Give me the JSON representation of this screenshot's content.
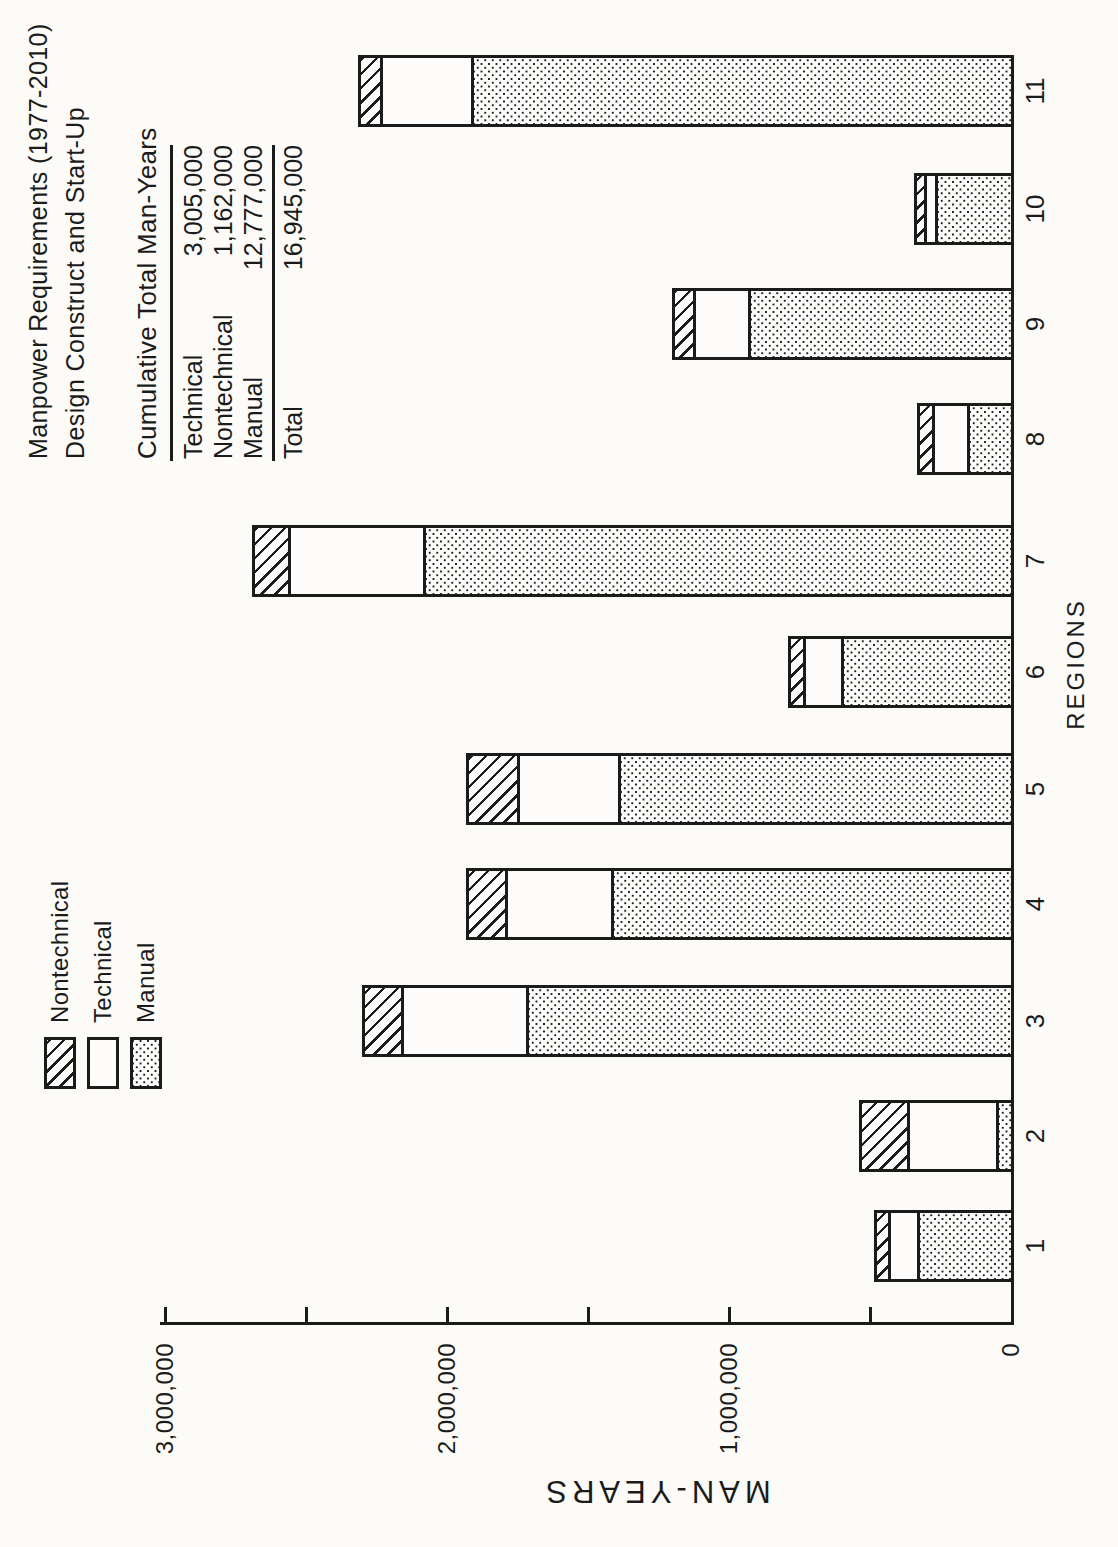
{
  "colors": {
    "ink": "#1b1b1b",
    "paper": "#fcfbf8"
  },
  "title": {
    "line1": "Manpower Requirements (1977-2010)",
    "line2": "Design Construct and Start-Up"
  },
  "summary_table": {
    "header": "Cumulative Total Man-Years",
    "rows": [
      {
        "label": "Technical",
        "value": "3,005,000"
      },
      {
        "label": "Nontechnical",
        "value": "1,162,000"
      },
      {
        "label": "Manual",
        "value": "12,777,000"
      }
    ],
    "total": {
      "label": "Total",
      "value": "16,945,000"
    }
  },
  "legend": {
    "items": [
      {
        "label": "Nontechnical",
        "pattern": "hatch"
      },
      {
        "label": "Technical",
        "pattern": "plain"
      },
      {
        "label": "Manual",
        "pattern": "dots"
      }
    ]
  },
  "axes": {
    "x_label": "REGIONS",
    "y_label": "MAN-YEARS"
  },
  "chart_data": {
    "type": "bar",
    "stacked": true,
    "title": "Manpower Requirements (1977-2010) Design Construct and Start-Up",
    "xlabel": "REGIONS",
    "ylabel": "MAN-YEARS",
    "ylim": [
      0,
      3000000
    ],
    "major_tick_interval": 1000000,
    "minor_tick_interval": 500000,
    "grid": false,
    "legend_position": "top-left",
    "note": "Figure is printed rotated 90° CCW on a portrait page; columns read as horizontal bars growing leftward from the right-hand baseline.",
    "categories": [
      "1",
      "2",
      "3",
      "4",
      "5",
      "6",
      "7",
      "8",
      "9",
      "10",
      "11"
    ],
    "series": [
      {
        "name": "Manual",
        "pattern": "dots",
        "values": [
          345000,
          65000,
          1730000,
          1430000,
          1405000,
          615000,
          2095000,
          165000,
          945000,
          280000,
          1925000
        ]
      },
      {
        "name": "Technical",
        "pattern": "plain",
        "values": [
          115000,
          325000,
          455000,
          385000,
          370000,
          145000,
          490000,
          135000,
          205000,
          50000,
          335000
        ]
      },
      {
        "name": "Nontechnical",
        "pattern": "hatch",
        "values": [
          60000,
          180000,
          150000,
          150000,
          190000,
          65000,
          140000,
          65000,
          85000,
          45000,
          90000
        ]
      }
    ],
    "y_ticks": [
      {
        "label": "3,000,000",
        "value": 3000000
      },
      {
        "label": "2,000,000",
        "value": 2000000
      },
      {
        "label": "1,000,000",
        "value": 1000000
      },
      {
        "label": "0",
        "value": 0
      }
    ]
  }
}
